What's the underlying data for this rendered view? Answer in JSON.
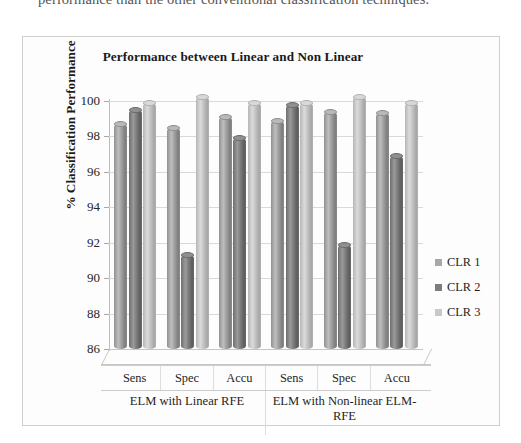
{
  "page": {
    "body_text_fragment": "performance than the other conventional classification techniques."
  },
  "figure": {
    "title": "Performance between Linear and Non Linear",
    "legend_position": "right",
    "colors": {
      "clr1": "#a8a8a8",
      "clr2": "#7d7d7d",
      "clr3": "#c8c8c8",
      "axis": "#bdbdbd",
      "grid": "#d9d9d9",
      "text": "#1a1a1a"
    }
  },
  "chart_data": {
    "type": "bar",
    "title": "Performance between Linear and Non Linear",
    "xlabel": "",
    "ylabel": "% Classification Performance",
    "ylim": [
      86,
      100
    ],
    "yticks": [
      86,
      88,
      90,
      92,
      94,
      96,
      98,
      100
    ],
    "grid": true,
    "categories": [
      "Sens",
      "Spec",
      "Accu",
      "Sens",
      "Spec",
      "Accu"
    ],
    "groups": [
      {
        "label": "ELM with Linear RFE",
        "categories": [
          "Sens",
          "Spec",
          "Accu"
        ]
      },
      {
        "label": "ELM with Non-linear ELM-RFE",
        "categories": [
          "Sens",
          "Spec",
          "Accu"
        ]
      }
    ],
    "series": [
      {
        "name": "CLR 1",
        "color": "#a8a8a8",
        "values": [
          98.7,
          98.5,
          99.1,
          98.9,
          99.4,
          99.3
        ]
      },
      {
        "name": "CLR 2",
        "color": "#7d7d7d",
        "values": [
          99.5,
          91.3,
          97.9,
          99.8,
          91.9,
          96.9
        ]
      },
      {
        "name": "CLR 3",
        "color": "#c8c8c8",
        "values": [
          99.9,
          100.2,
          99.9,
          99.9,
          100.2,
          99.9
        ]
      }
    ],
    "legend": [
      "CLR 1",
      "CLR 2",
      "CLR 3"
    ]
  }
}
